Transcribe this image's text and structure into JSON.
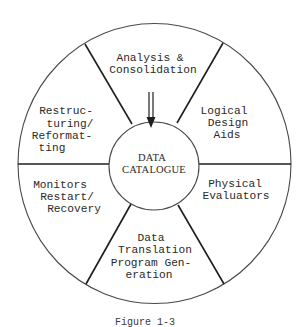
{
  "diagram": {
    "type": "wheel",
    "center": {
      "lines": [
        "DATA",
        "CATALOGUE"
      ]
    },
    "segments": [
      {
        "id": "analysis",
        "lines": [
          "Analysis &",
          "Consolidation"
        ],
        "position": "top"
      },
      {
        "id": "logical-design",
        "lines": [
          "Logical",
          "Design",
          "Aids"
        ],
        "position": "upper-right"
      },
      {
        "id": "physical-evaluators",
        "lines": [
          "Physical",
          "Evaluators"
        ],
        "position": "lower-right"
      },
      {
        "id": "data-translation",
        "lines": [
          "Data",
          "Translation",
          "Program Gen-",
          "eration"
        ],
        "position": "bottom"
      },
      {
        "id": "monitors",
        "lines": [
          "Monitors",
          "Restart/",
          "Recovery"
        ],
        "position": "lower-left"
      },
      {
        "id": "restructuring",
        "lines": [
          "Restruc-",
          "turing/",
          "Reformat-",
          "ting"
        ],
        "position": "upper-left"
      }
    ],
    "arrow": {
      "from": "analysis",
      "to": "center",
      "style": "double-shaft"
    },
    "colors": {
      "stroke": "#1e1e1e",
      "text": "#2a2a2a",
      "background": "#ffffff"
    }
  },
  "caption": "Figure 1-3"
}
